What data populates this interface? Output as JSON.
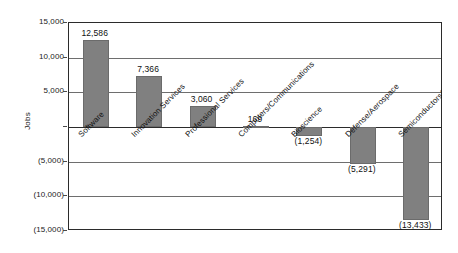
{
  "chart_data": {
    "type": "bar",
    "title": "",
    "subtitle": "",
    "xlabel": "",
    "ylabel": "Jobs",
    "ylim": [
      -15000,
      15000
    ],
    "grid": true,
    "legend_position": "none",
    "bar_color": "#808080",
    "categories": [
      "Software",
      "Innovation Services",
      "Professional Services",
      "Computers/Communications",
      "Bioscience",
      "Defense/Aerospace",
      "Semiconductors/Equipment"
    ],
    "values": [
      12586,
      7366,
      3060,
      169,
      -1254,
      -5291,
      -13433
    ],
    "data_labels": [
      "12,586",
      "7,366",
      "3,060",
      "169",
      "(1,254)",
      "(5,291)",
      "(13,433)"
    ],
    "ytick_values": [
      15000,
      10000,
      5000,
      0,
      -5000,
      -10000,
      -15000
    ],
    "ytick_labels": [
      "15,000",
      "10,000",
      "5,000",
      "",
      "(5,000)",
      "(10,000)",
      "(15,000)"
    ]
  }
}
